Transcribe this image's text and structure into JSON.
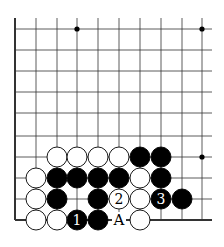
{
  "board": {
    "cols_x": [
      15,
      36,
      57,
      77,
      98,
      119,
      140,
      161,
      182,
      202
    ],
    "rows_y": [
      29,
      50,
      71,
      92,
      113,
      136,
      157,
      178,
      199,
      220
    ],
    "top_extend_y": 18,
    "right_extend_x": 212,
    "edges": {
      "left": true,
      "bottom": true,
      "top": false,
      "right": false
    },
    "star_points": [
      [
        3,
        0
      ],
      [
        9,
        0
      ],
      [
        9,
        6
      ]
    ],
    "stone_radius": 10,
    "colors": {
      "black": "#000000",
      "white": "#ffffff",
      "line": "#333333"
    }
  },
  "stones": [
    {
      "col": 2,
      "row": 6,
      "color": "white"
    },
    {
      "col": 3,
      "row": 6,
      "color": "white"
    },
    {
      "col": 4,
      "row": 6,
      "color": "white"
    },
    {
      "col": 5,
      "row": 6,
      "color": "white"
    },
    {
      "col": 6,
      "row": 6,
      "color": "black"
    },
    {
      "col": 7,
      "row": 6,
      "color": "black"
    },
    {
      "col": 1,
      "row": 7,
      "color": "white"
    },
    {
      "col": 2,
      "row": 7,
      "color": "black"
    },
    {
      "col": 3,
      "row": 7,
      "color": "black"
    },
    {
      "col": 4,
      "row": 7,
      "color": "black"
    },
    {
      "col": 5,
      "row": 7,
      "color": "black"
    },
    {
      "col": 6,
      "row": 7,
      "color": "white"
    },
    {
      "col": 7,
      "row": 7,
      "color": "black"
    },
    {
      "col": 1,
      "row": 8,
      "color": "white"
    },
    {
      "col": 2,
      "row": 8,
      "color": "black"
    },
    {
      "col": 4,
      "row": 8,
      "color": "black"
    },
    {
      "col": 5,
      "row": 8,
      "color": "white",
      "label": "2"
    },
    {
      "col": 6,
      "row": 8,
      "color": "white"
    },
    {
      "col": 7,
      "row": 8,
      "color": "black",
      "label": "3"
    },
    {
      "col": 8,
      "row": 8,
      "color": "black"
    },
    {
      "col": 1,
      "row": 9,
      "color": "white"
    },
    {
      "col": 2,
      "row": 9,
      "color": "white"
    },
    {
      "col": 3,
      "row": 9,
      "color": "black",
      "label": "1"
    },
    {
      "col": 4,
      "row": 9,
      "color": "black"
    },
    {
      "col": 6,
      "row": 9,
      "color": "white"
    }
  ],
  "marks": [
    {
      "col": 5,
      "row": 9,
      "label": "A"
    }
  ]
}
